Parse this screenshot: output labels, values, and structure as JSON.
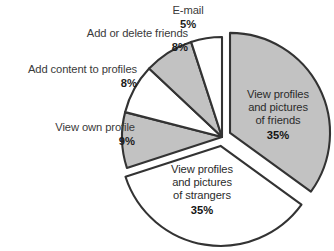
{
  "chart_data": {
    "type": "pie",
    "title": "",
    "subtitle": "",
    "xlabel": "",
    "ylabel": "",
    "legend_position": "none",
    "grid": false,
    "labels_inside_slices": [
      "View profiles and pictures of friends",
      "View profiles and pictures of strangers"
    ],
    "categories": [
      "View profiles and pictures of friends",
      "View profiles and pictures of strangers",
      "View own profile",
      "Add content to profiles",
      "Add or delete friends",
      "E-mail"
    ],
    "values": [
      35,
      35,
      9,
      8,
      8,
      5
    ],
    "value_unit": "%",
    "slices": [
      {
        "id": "friends",
        "label": "View profiles and pictures of friends",
        "label_lines": [
          "View profiles",
          "and pictures",
          "of friends"
        ],
        "value": 35,
        "percent_text": "35%",
        "fill": "#c2c2c2",
        "exploded": true,
        "label_placement": "inside"
      },
      {
        "id": "strangers",
        "label": "View profiles and pictures of strangers",
        "label_lines": [
          "View profiles",
          "and pictures",
          "of strangers"
        ],
        "value": 35,
        "percent_text": "35%",
        "fill": "#ffffff",
        "exploded": true,
        "label_placement": "inside"
      },
      {
        "id": "view-own-profile",
        "label": "View own profile",
        "label_lines": [
          "View own profile"
        ],
        "value": 9,
        "percent_text": "9%",
        "fill": "#c2c2c2",
        "exploded": false,
        "label_placement": "outside"
      },
      {
        "id": "add-content-to-profiles",
        "label": "Add content to profiles",
        "label_lines": [
          "Add content to profiles"
        ],
        "value": 8,
        "percent_text": "8%",
        "fill": "#ffffff",
        "exploded": false,
        "label_placement": "outside"
      },
      {
        "id": "add-or-delete-friends",
        "label": "Add or delete friends",
        "label_lines": [
          "Add or delete friends"
        ],
        "value": 8,
        "percent_text": "8%",
        "fill": "#c2c2c2",
        "exploded": false,
        "label_placement": "outside"
      },
      {
        "id": "email",
        "label": "E-mail",
        "label_lines": [
          "E-mail"
        ],
        "value": 5,
        "percent_text": "5%",
        "fill": "#ffffff",
        "exploded": false,
        "label_placement": "outside"
      }
    ],
    "colors": {
      "slice_gray": "#c2c2c2",
      "slice_white": "#ffffff",
      "outline": "#333333",
      "background": "#ffffff",
      "label_text": "#3a3a3a",
      "percent_text": "#1d1d1d"
    }
  }
}
